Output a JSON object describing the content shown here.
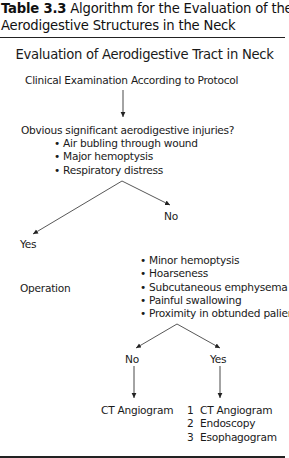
{
  "caption": {
    "label": "Table 3.3",
    "line1": " Algorithm for the Evaluation of the",
    "line2": "Aerodigestive Structures in the Neck"
  },
  "flowchart": {
    "title": "Evaluation of Aerodigestive Tract in Neck",
    "start": "Clinical Examination According to Protocol",
    "question1": {
      "text": "Obvious significant aerodigestive injuries?",
      "bullets": [
        "Air bubling through wound",
        "Major hemoptysis",
        "Respiratory distress"
      ],
      "yes_label": "Yes",
      "no_label": "No"
    },
    "yes_outcome": "Operation",
    "question2": {
      "bullets": [
        "Minor hemoptysis",
        "Hoarseness",
        "Subcutaneous emphysema",
        "Painful swallowing",
        "Proximity in obtunded palient"
      ],
      "no_label": "No",
      "yes_label": "Yes"
    },
    "no_outcome": "CT Angiogram",
    "yes_outcomes": [
      {
        "num": "1",
        "text": "CT Angiogram"
      },
      {
        "num": "2",
        "text": "Endoscopy"
      },
      {
        "num": "3",
        "text": "Esophagogram"
      }
    ]
  }
}
